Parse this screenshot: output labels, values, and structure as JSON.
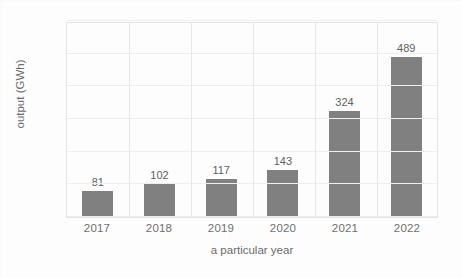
{
  "chart_data": {
    "type": "bar",
    "title": "",
    "categories": [
      "2017",
      "2018",
      "2019",
      "2020",
      "2021",
      "2022"
    ],
    "values": [
      81,
      102,
      117,
      143,
      324,
      489
    ],
    "xlabel": "a particular year",
    "ylabel": "output (GWh)",
    "ylim": [
      0,
      600
    ],
    "yticks": [
      0,
      100,
      200,
      300,
      400,
      500,
      600
    ],
    "ytick_labels": [
      "0",
      "100",
      "200",
      "300",
      "400",
      "500",
      "600"
    ],
    "data_labels": [
      "81",
      "102",
      "117",
      "143",
      "324",
      "489"
    ],
    "grid": "horizontal-and-vertical",
    "legend": "none",
    "bar_color": "#808080",
    "grid_color": "#eeeeee",
    "plot_border_color": "#e3e3e3",
    "text_color": "#6f6f6f",
    "background_color": "#fdfdfd"
  }
}
